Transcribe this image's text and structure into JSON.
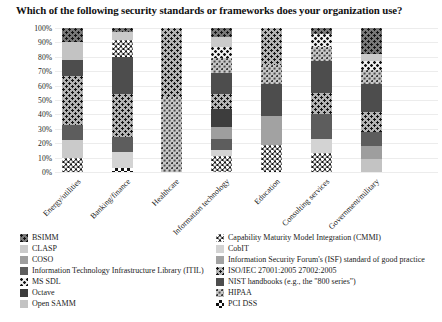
{
  "chart_data": {
    "type": "bar",
    "stacked": true,
    "title": "Which of the following security standards or frameworks does your organization use?",
    "ylabel": "",
    "xlabel": "",
    "ylim": [
      0,
      100
    ],
    "unit": "percent",
    "grid": true,
    "legend_position": "bottom-two-columns",
    "y_ticks": [
      "0%",
      "10%",
      "20%",
      "30%",
      "40%",
      "50%",
      "60%",
      "70%",
      "80%",
      "90%",
      "100%"
    ],
    "categories": [
      "Energy/utilities",
      "Banking/finance",
      "Healthcare",
      "Information technology",
      "Education",
      "Consulting services",
      "Government/military"
    ],
    "series": [
      {
        "id": "bsimm",
        "label": "BSIMM",
        "pattern": "dark-dots"
      },
      {
        "id": "clasp",
        "label": "CLASP",
        "pattern": "solid-light"
      },
      {
        "id": "coso",
        "label": "COSO",
        "pattern": "solid-med"
      },
      {
        "id": "itil",
        "label": "Information Technology Infrastructure Library (ITIL)",
        "pattern": "solid-dark2"
      },
      {
        "id": "mssdl",
        "label": "MS SDL",
        "pattern": "light-dot-check"
      },
      {
        "id": "octave",
        "label": "Octave",
        "pattern": "solid-darkest"
      },
      {
        "id": "opensamm",
        "label": "Open SAMM",
        "pattern": "solid-light2"
      },
      {
        "id": "cmmi",
        "label": "Capability Maturity Model Integration (CMMI)",
        "pattern": "black-white-dots"
      },
      {
        "id": "cobit",
        "label": "CobIT",
        "pattern": "solid-lighter"
      },
      {
        "id": "isf",
        "label": "Information Security Forum's (ISF) standard of good practice",
        "pattern": "solid-med2"
      },
      {
        "id": "iso",
        "label": "ISO/IEC 27001:2005 27002:2005",
        "pattern": "gray-black-dots"
      },
      {
        "id": "nist",
        "label": "NIST handbooks (e.g., the \"800 series\")",
        "pattern": "solid-dark"
      },
      {
        "id": "hipaa",
        "label": "HIPAA",
        "pattern": "light-speckle"
      },
      {
        "id": "pci",
        "label": "PCI DSS",
        "pattern": "fine-checker"
      }
    ],
    "legend": {
      "left": [
        "bsimm",
        "clasp",
        "coso",
        "itil",
        "mssdl",
        "octave",
        "opensamm"
      ],
      "right": [
        "cmmi",
        "cobit",
        "isf",
        "iso",
        "nist",
        "hipaa",
        "pci"
      ]
    },
    "bars": [
      {
        "category": "Energy/utilities",
        "segments": [
          {
            "series": "cmmi",
            "value": 10
          },
          {
            "series": "clasp",
            "value": 12
          },
          {
            "series": "itil",
            "value": 11
          },
          {
            "series": "iso",
            "value": 34
          },
          {
            "series": "nist",
            "value": 11
          },
          {
            "series": "opensamm",
            "value": 12
          },
          {
            "series": "bsimm",
            "value": 10
          }
        ]
      },
      {
        "category": "Banking/finance",
        "segments": [
          {
            "series": "pci",
            "value": 3
          },
          {
            "series": "cobit",
            "value": 11
          },
          {
            "series": "itil",
            "value": 10
          },
          {
            "series": "iso",
            "value": 30
          },
          {
            "series": "nist",
            "value": 26
          },
          {
            "series": "cmmi",
            "value": 12
          },
          {
            "series": "clasp",
            "value": 5
          },
          {
            "series": "bsimm",
            "value": 3
          }
        ]
      },
      {
        "category": "Healthcare",
        "segments": [
          {
            "series": "hipaa",
            "value": 52
          },
          {
            "series": "iso",
            "value": 48
          }
        ]
      },
      {
        "category": "Information technology",
        "segments": [
          {
            "series": "cmmi",
            "value": 11
          },
          {
            "series": "cobit",
            "value": 4
          },
          {
            "series": "itil",
            "value": 8
          },
          {
            "series": "coso",
            "value": 8
          },
          {
            "series": "octave",
            "value": 13
          },
          {
            "series": "iso",
            "value": 10
          },
          {
            "series": "nist",
            "value": 15
          },
          {
            "series": "hipaa",
            "value": 10
          },
          {
            "series": "mssdl",
            "value": 8
          },
          {
            "series": "clasp",
            "value": 7
          },
          {
            "series": "bsimm",
            "value": 6
          }
        ]
      },
      {
        "category": "Education",
        "segments": [
          {
            "series": "cmmi",
            "value": 19
          },
          {
            "series": "isf",
            "value": 20
          },
          {
            "series": "nist",
            "value": 22
          },
          {
            "series": "hipaa",
            "value": 13
          },
          {
            "series": "iso",
            "value": 26
          }
        ]
      },
      {
        "category": "Consulting services",
        "segments": [
          {
            "series": "cmmi",
            "value": 13
          },
          {
            "series": "cobit",
            "value": 10
          },
          {
            "series": "itil",
            "value": 17
          },
          {
            "series": "iso",
            "value": 15
          },
          {
            "series": "nist",
            "value": 22
          },
          {
            "series": "hipaa",
            "value": 10
          },
          {
            "series": "mssdl",
            "value": 9
          },
          {
            "series": "bsimm",
            "value": 4
          }
        ]
      },
      {
        "category": "Government/military",
        "segments": [
          {
            "series": "opensamm",
            "value": 9
          },
          {
            "series": "coso",
            "value": 9
          },
          {
            "series": "itil",
            "value": 10
          },
          {
            "series": "iso",
            "value": 14
          },
          {
            "series": "nist",
            "value": 19
          },
          {
            "series": "hipaa",
            "value": 10
          },
          {
            "series": "mssdl",
            "value": 6
          },
          {
            "series": "clasp",
            "value": 5
          },
          {
            "series": "bsimm",
            "value": 18
          }
        ]
      }
    ]
  }
}
